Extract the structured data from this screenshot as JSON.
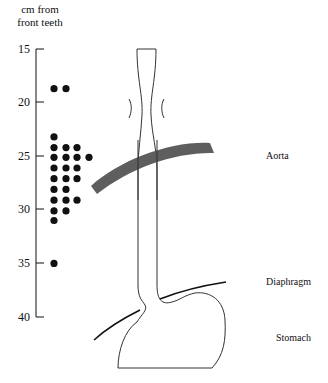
{
  "figure": {
    "axis_title_line1": "cm  from",
    "axis_title_line2": "front teeth",
    "ticks": [
      {
        "label": "15",
        "y": 49
      },
      {
        "label": "20",
        "y": 102
      },
      {
        "label": "25",
        "y": 156
      },
      {
        "label": "30",
        "y": 209
      },
      {
        "label": "35",
        "y": 263
      },
      {
        "label": "40",
        "y": 317
      }
    ],
    "labels": {
      "aorta": "Aorta",
      "diaphragm": "Diaphragm",
      "stomach": "Stomach"
    },
    "colors": {
      "ink": "#111111",
      "aorta_fill": "#555555"
    }
  },
  "chart_data": {
    "type": "scatter",
    "title": "",
    "ylabel": "cm from front teeth",
    "xlabel": "",
    "ylim": [
      15,
      40
    ],
    "yticks": [
      15,
      20,
      25,
      30,
      35,
      40
    ],
    "y_inverted": true,
    "series": [
      {
        "name": "distance of lesions from front teeth",
        "points": [
          {
            "col": 1,
            "cm": 18.7
          },
          {
            "col": 2,
            "cm": 18.7
          },
          {
            "col": 1,
            "cm": 23.2
          },
          {
            "col": 1,
            "cm": 24.2
          },
          {
            "col": 2,
            "cm": 24.2
          },
          {
            "col": 3,
            "cm": 24.2
          },
          {
            "col": 1,
            "cm": 25.1
          },
          {
            "col": 2,
            "cm": 25.1
          },
          {
            "col": 3,
            "cm": 25.1
          },
          {
            "col": 4,
            "cm": 25.1
          },
          {
            "col": 1,
            "cm": 26.1
          },
          {
            "col": 2,
            "cm": 26.1
          },
          {
            "col": 3,
            "cm": 26.1
          },
          {
            "col": 1,
            "cm": 27.1
          },
          {
            "col": 2,
            "cm": 27.1
          },
          {
            "col": 3,
            "cm": 27.1
          },
          {
            "col": 1,
            "cm": 28.1
          },
          {
            "col": 2,
            "cm": 28.1
          },
          {
            "col": 1,
            "cm": 29.1
          },
          {
            "col": 2,
            "cm": 29.1
          },
          {
            "col": 3,
            "cm": 29.1
          },
          {
            "col": 1,
            "cm": 30.1
          },
          {
            "col": 2,
            "cm": 30.1
          },
          {
            "col": 1,
            "cm": 31.0
          },
          {
            "col": 1,
            "cm": 35.0
          }
        ]
      }
    ],
    "annotations": [
      "Aorta",
      "Diaphragm",
      "Stomach"
    ]
  }
}
